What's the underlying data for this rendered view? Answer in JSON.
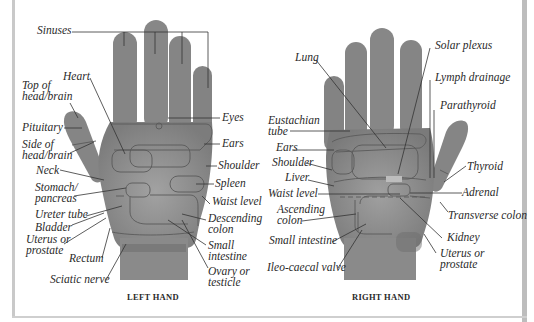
{
  "figure": {
    "type": "hand reflexology chart",
    "colors": {
      "hand_fill": "#8a8a8a",
      "hand_shadow": "#6e6e6e",
      "zone_outline": "#5a5a5a",
      "leader_line": "#333333",
      "text": "#2a2a2a",
      "page_edge": "#c4c4c4"
    }
  },
  "left_hand": {
    "caption": "LEFT HAND",
    "labels": {
      "sinuses": "Sinuses",
      "heart": "Heart",
      "top_head": "Top of\nhead/brain",
      "pituitary": "Pituitary",
      "side_head": "Side of\nhead/brain",
      "neck": "Neck",
      "stomach": "Stomach/\npancreas",
      "ureter": "Ureter tube",
      "bladder": "Bladder",
      "uterus": "Uterus or\nprostate",
      "rectum": "Rectum",
      "sciatic": "Sciatic nerve",
      "eyes": "Eyes",
      "ears": "Ears",
      "shoulder": "Shoulder",
      "spleen": "Spleen",
      "waist": "Waist level",
      "descending": "Descending\ncolon",
      "small_intestine": "Small\nintestine",
      "ovary": "Ovary or\ntesticle"
    }
  },
  "right_hand": {
    "caption": "RIGHT HAND",
    "labels": {
      "lung": "Lung",
      "solar_plexus": "Solar plexus",
      "lymph": "Lymph drainage",
      "parathyroid": "Parathyroid",
      "eustachian": "Eustachian\ntube",
      "ears": "Ears",
      "shoulder": "Shoulder",
      "liver": "Liver",
      "waist": "Waist level",
      "ascending": "Ascending\ncolon",
      "small_intestine": "Small intestine",
      "ileo": "Ileo-caecal valve",
      "thyroid": "Thyroid",
      "adrenal": "Adrenal",
      "transverse": "Transverse colon",
      "kidney": "Kidney",
      "uterus": "Uterus or\nprostate"
    }
  }
}
